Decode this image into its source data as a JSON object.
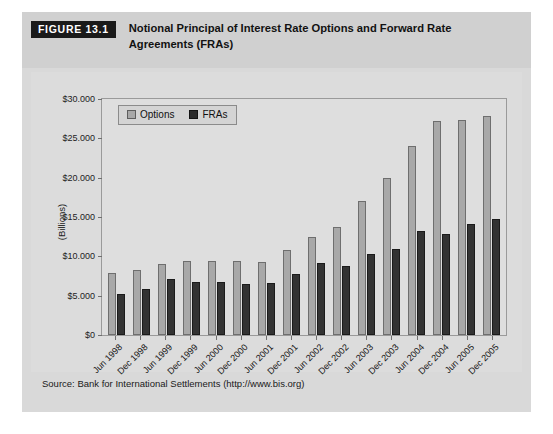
{
  "figure": {
    "badge": "FIGURE 13.1",
    "title": "Notional Principal of Interest Rate Options and Forward Rate Agreements (FRAs)",
    "source": "Source: Bank for International Settlements (http://www.bis.org)"
  },
  "colors": {
    "options_fill": "#a8a8a8",
    "options_stroke": "#6e6e6e",
    "fras_fill": "#333333",
    "fras_stroke": "#1b1b1b",
    "plate_background": "#dcdcdc",
    "header_background": "#d0d0d0",
    "badge_background": "#1a1a1a"
  },
  "legend": {
    "position": "top-left-inside",
    "entries": [
      {
        "label": "Options",
        "swatch": "options-swatch"
      },
      {
        "label": "FRAs",
        "swatch": "fras-swatch"
      }
    ]
  },
  "chart_data": {
    "type": "bar",
    "title": "Notional Principal of Interest Rate Options and Forward Rate Agreements (FRAs)",
    "xlabel": "",
    "ylabel": "(Billions)",
    "ylim": [
      0,
      30000
    ],
    "ytick_labels": [
      "$0",
      "$5.000",
      "$10.000",
      "$15.000",
      "$20.000",
      "$25.000",
      "$30.000"
    ],
    "ytick_values": [
      0,
      5000,
      10000,
      15000,
      20000,
      25000,
      30000
    ],
    "grid": false,
    "legend_position": "upper left",
    "categories": [
      "Jun 1998",
      "Dec 1998",
      "Jun 1999",
      "Dec 1999",
      "Jun 2000",
      "Dec 2000",
      "Jun 2001",
      "Dec 2001",
      "Jun 2002",
      "Dec 2002",
      "Jun 2003",
      "Dec 2003",
      "Jun 2004",
      "Dec 2004",
      "Jun 2005",
      "Dec 2005"
    ],
    "series": [
      {
        "name": "Options",
        "values": [
          7900,
          8300,
          9000,
          9400,
          9400,
          9400,
          9300,
          10800,
          12500,
          13700,
          17000,
          20000,
          24000,
          27200,
          27300,
          27900
        ]
      },
      {
        "name": "FRAs",
        "values": [
          5200,
          5800,
          7100,
          6800,
          6800,
          6500,
          6600,
          7800,
          9200,
          8800,
          10300,
          10900,
          13200,
          12800,
          14100,
          14700
        ]
      }
    ]
  }
}
